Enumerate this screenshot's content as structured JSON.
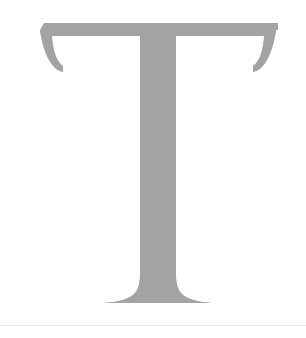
{
  "page": {
    "background_color": "#ffffff",
    "width": 306,
    "height": 338
  },
  "glyph": {
    "character": "T",
    "name": "letter-t-glyph",
    "style": "serif-didone",
    "fill_color": "#a3a3a3",
    "case": "uppercase",
    "metrics": {
      "cap_top_y": 23,
      "baseline_y": 303,
      "crossbar_left_x": 44,
      "crossbar_right_x": 278,
      "crossbar_thickness": 13,
      "serif_drop_y": 72,
      "stem_left_x": 134,
      "stem_right_x": 176,
      "foot_left_x": 104,
      "foot_right_x": 212
    }
  },
  "footer": {
    "rule_color": "#e6e6e6",
    "rule_y": 325,
    "rule_thickness": 1
  }
}
